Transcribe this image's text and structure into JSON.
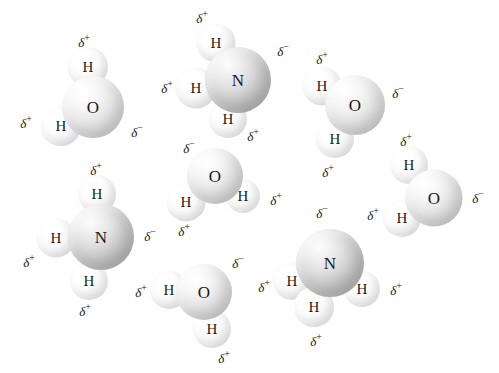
{
  "figure": {
    "background_color": "#ffffff",
    "width": 499,
    "height": 373,
    "symbols": {
      "delta_positive": "δ",
      "delta_positive_sign": "+",
      "delta_negative": "δ",
      "delta_negative_sign": "−",
      "oxygen": "O",
      "nitrogen": "N",
      "hydrogen": "H"
    },
    "colors": {
      "label_color": "#1a1a1a",
      "heavy_atom": "#e0e0e0",
      "nitrogen_atom": "#cccccc",
      "hydrogen_atom": "#fafafa"
    }
  },
  "molecules": [
    {
      "name": "water-top-left",
      "formula": "H2O",
      "atoms": [
        {
          "element": "O",
          "kind": "heavy",
          "x": 93,
          "y": 107,
          "d": 62,
          "font": 17
        },
        {
          "element": "H",
          "kind": "light",
          "x": 88,
          "y": 67,
          "d": 40,
          "font": 15
        },
        {
          "element": "H",
          "kind": "light",
          "x": 61,
          "y": 126,
          "d": 40,
          "font": 15
        }
      ],
      "charges": [
        {
          "sign": "+",
          "x": 84,
          "y": 42
        },
        {
          "sign": "+",
          "x": 26,
          "y": 123
        },
        {
          "sign": "-",
          "x": 137,
          "y": 132
        }
      ]
    },
    {
      "name": "ammonia-top-middle",
      "formula": "NH3",
      "atoms": [
        {
          "element": "N",
          "kind": "nitrogen",
          "x": 238,
          "y": 80,
          "d": 66,
          "font": 17
        },
        {
          "element": "H",
          "kind": "light",
          "x": 216,
          "y": 43,
          "d": 39,
          "font": 15
        },
        {
          "element": "H",
          "kind": "light",
          "x": 196,
          "y": 88,
          "d": 41,
          "font": 15
        },
        {
          "element": "H",
          "kind": "light",
          "x": 228,
          "y": 119,
          "d": 38,
          "font": 15
        }
      ],
      "charges": [
        {
          "sign": "+",
          "x": 202,
          "y": 18
        },
        {
          "sign": "+",
          "x": 167,
          "y": 88
        },
        {
          "sign": "+",
          "x": 253,
          "y": 136
        },
        {
          "sign": "-",
          "x": 283,
          "y": 51
        }
      ]
    },
    {
      "name": "water-top-right",
      "formula": "H2O",
      "atoms": [
        {
          "element": "O",
          "kind": "heavy",
          "x": 355,
          "y": 105,
          "d": 60,
          "font": 17
        },
        {
          "element": "H",
          "kind": "light",
          "x": 322,
          "y": 86,
          "d": 39,
          "font": 15
        },
        {
          "element": "H",
          "kind": "light",
          "x": 335,
          "y": 139,
          "d": 38,
          "font": 15
        }
      ],
      "charges": [
        {
          "sign": "+",
          "x": 322,
          "y": 59
        },
        {
          "sign": "+",
          "x": 328,
          "y": 172
        },
        {
          "sign": "-",
          "x": 398,
          "y": 93
        }
      ]
    },
    {
      "name": "water-center",
      "formula": "H2O",
      "atoms": [
        {
          "element": "O",
          "kind": "heavy",
          "x": 215,
          "y": 176,
          "d": 56,
          "font": 17
        },
        {
          "element": "H",
          "kind": "light",
          "x": 186,
          "y": 202,
          "d": 39,
          "font": 15
        },
        {
          "element": "H",
          "kind": "light",
          "x": 243,
          "y": 196,
          "d": 34,
          "font": 15
        }
      ],
      "charges": [
        {
          "sign": "-",
          "x": 189,
          "y": 148
        },
        {
          "sign": "+",
          "x": 184,
          "y": 231
        },
        {
          "sign": "+",
          "x": 276,
          "y": 200
        }
      ]
    },
    {
      "name": "water-right",
      "formula": "H2O",
      "atoms": [
        {
          "element": "O",
          "kind": "heavy",
          "x": 434,
          "y": 198,
          "d": 57,
          "font": 17
        },
        {
          "element": "H",
          "kind": "light",
          "x": 409,
          "y": 165,
          "d": 38,
          "font": 15
        },
        {
          "element": "H",
          "kind": "light",
          "x": 402,
          "y": 218,
          "d": 38,
          "font": 15
        }
      ],
      "charges": [
        {
          "sign": "+",
          "x": 406,
          "y": 141
        },
        {
          "sign": "+",
          "x": 373,
          "y": 215
        },
        {
          "sign": "-",
          "x": 478,
          "y": 198
        }
      ]
    },
    {
      "name": "ammonia-left",
      "formula": "NH3",
      "atoms": [
        {
          "element": "N",
          "kind": "nitrogen",
          "x": 101,
          "y": 237,
          "d": 66,
          "font": 17
        },
        {
          "element": "H",
          "kind": "light",
          "x": 97,
          "y": 194,
          "d": 38,
          "font": 15
        },
        {
          "element": "H",
          "kind": "light",
          "x": 56,
          "y": 238,
          "d": 39,
          "font": 15
        },
        {
          "element": "H",
          "kind": "light",
          "x": 89,
          "y": 281,
          "d": 38,
          "font": 15
        }
      ],
      "charges": [
        {
          "sign": "+",
          "x": 96,
          "y": 170
        },
        {
          "sign": "+",
          "x": 29,
          "y": 262
        },
        {
          "sign": "+",
          "x": 85,
          "y": 311
        },
        {
          "sign": "-",
          "x": 150,
          "y": 236
        }
      ]
    },
    {
      "name": "water-bottom",
      "formula": "H2O",
      "atoms": [
        {
          "element": "O",
          "kind": "heavy",
          "x": 204,
          "y": 292,
          "d": 56,
          "font": 17
        },
        {
          "element": "H",
          "kind": "light",
          "x": 169,
          "y": 290,
          "d": 38,
          "font": 15
        },
        {
          "element": "H",
          "kind": "light",
          "x": 212,
          "y": 329,
          "d": 38,
          "font": 15
        }
      ],
      "charges": [
        {
          "sign": "-",
          "x": 238,
          "y": 263
        },
        {
          "sign": "+",
          "x": 141,
          "y": 292
        },
        {
          "sign": "+",
          "x": 224,
          "y": 358
        }
      ]
    },
    {
      "name": "ammonia-bottom-right",
      "formula": "NH3",
      "atoms": [
        {
          "element": "N",
          "kind": "nitrogen",
          "x": 330,
          "y": 263,
          "d": 68,
          "font": 17
        },
        {
          "element": "H",
          "kind": "light",
          "x": 292,
          "y": 281,
          "d": 38,
          "font": 15
        },
        {
          "element": "H",
          "kind": "light",
          "x": 314,
          "y": 307,
          "d": 40,
          "font": 15
        },
        {
          "element": "H",
          "kind": "light",
          "x": 362,
          "y": 289,
          "d": 36,
          "font": 15
        }
      ],
      "charges": [
        {
          "sign": "-",
          "x": 322,
          "y": 213
        },
        {
          "sign": "+",
          "x": 264,
          "y": 287
        },
        {
          "sign": "+",
          "x": 316,
          "y": 341
        },
        {
          "sign": "+",
          "x": 396,
          "y": 290
        }
      ]
    }
  ]
}
